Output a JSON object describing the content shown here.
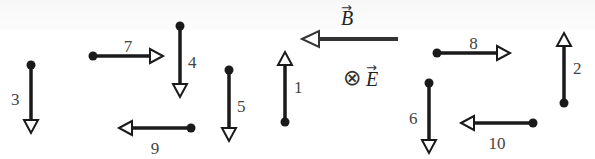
{
  "diagram": {
    "colors": {
      "stroke": "#1a1a1a",
      "label": "#444444",
      "field": "#333333",
      "background": "#ffffff"
    },
    "fields": {
      "B": {
        "label": "B",
        "direction": "left",
        "arrow_glyph": "→"
      },
      "E": {
        "label": "E",
        "direction": "into-page",
        "symbol": "⊗",
        "arrow_glyph": "→"
      }
    },
    "arrows": [
      {
        "id": 1,
        "label": "1",
        "direction": "up",
        "start": [
          285,
          122
        ],
        "end": [
          285,
          52
        ]
      },
      {
        "id": 2,
        "label": "2",
        "direction": "up",
        "start": [
          564,
          103
        ],
        "end": [
          564,
          33
        ]
      },
      {
        "id": 3,
        "label": "3",
        "direction": "down",
        "start": [
          31,
          65
        ],
        "end": [
          31,
          133
        ]
      },
      {
        "id": 4,
        "label": "4",
        "direction": "down",
        "start": [
          180,
          26
        ],
        "end": [
          180,
          97
        ]
      },
      {
        "id": 5,
        "label": "5",
        "direction": "down",
        "start": [
          229,
          70
        ],
        "end": [
          229,
          141
        ]
      },
      {
        "id": 6,
        "label": "6",
        "direction": "down",
        "start": [
          429,
          83
        ],
        "end": [
          429,
          153
        ]
      },
      {
        "id": 7,
        "label": "7",
        "direction": "right",
        "start": [
          93,
          56
        ],
        "end": [
          163,
          56
        ]
      },
      {
        "id": 8,
        "label": "8",
        "direction": "right",
        "start": [
          437,
          53
        ],
        "end": [
          510,
          53
        ]
      },
      {
        "id": 9,
        "label": "9",
        "direction": "left",
        "start": [
          191,
          128
        ],
        "end": [
          119,
          128
        ]
      },
      {
        "id": 10,
        "label": "10",
        "direction": "left",
        "start": [
          533,
          123
        ],
        "end": [
          461,
          123
        ]
      }
    ]
  }
}
